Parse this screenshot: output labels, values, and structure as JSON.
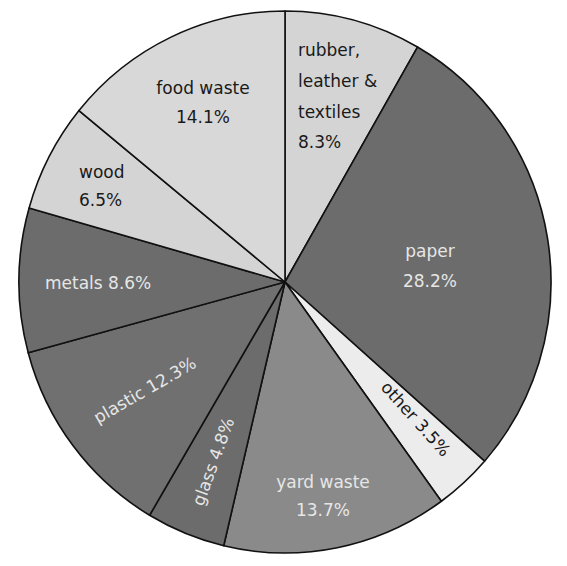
{
  "chart_data": {
    "type": "pie",
    "title": "",
    "start_angle_deg": 0,
    "direction": "clockwise",
    "slices": [
      {
        "label": "rubber, leather & textiles",
        "value": 8.3,
        "display": "8.3%",
        "color": "#d4d4d4",
        "text": "dark"
      },
      {
        "label": "paper",
        "value": 28.2,
        "display": "28.2%",
        "color": "#6c6c6c",
        "text": "light"
      },
      {
        "label": "other",
        "value": 3.5,
        "display": "3.5%",
        "color": "#ececec",
        "text": "dark"
      },
      {
        "label": "yard waste",
        "value": 13.7,
        "display": "13.7%",
        "color": "#8a8a8a",
        "text": "light"
      },
      {
        "label": "glass",
        "value": 4.8,
        "display": "4.8%",
        "color": "#6c6c6c",
        "text": "light"
      },
      {
        "label": "plastic",
        "value": 12.3,
        "display": "12.3%",
        "color": "#707070",
        "text": "light"
      },
      {
        "label": "metals",
        "value": 8.6,
        "display": "8.6%",
        "color": "#6c6c6c",
        "text": "light"
      },
      {
        "label": "wood",
        "value": 6.5,
        "display": "6.5%",
        "color": "#d4d4d4",
        "text": "dark"
      },
      {
        "label": "food waste",
        "value": 14.1,
        "display": "14.1%",
        "color": "#d8d8d8",
        "text": "dark"
      }
    ],
    "legend": "none (labels inside slices)"
  },
  "labels": {
    "rubber": [
      "rubber,",
      "leather &",
      "textiles",
      "8.3%"
    ],
    "paper": [
      "paper",
      "28.2%"
    ],
    "other": "other 3.5%",
    "yard": [
      "yard waste",
      "13.7%"
    ],
    "glass": "glass 4.8%",
    "plastic": "plastic 12.3%",
    "metals": "metals 8.6%",
    "wood": [
      "wood",
      "6.5%"
    ],
    "food": [
      "food waste",
      "14.1%"
    ]
  }
}
